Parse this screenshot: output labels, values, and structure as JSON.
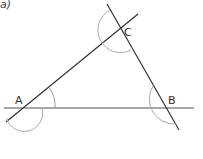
{
  "part_label": "a)",
  "vertices": {
    "A": {
      "label": "A"
    },
    "B": {
      "label": "B"
    },
    "C": {
      "label": "C"
    }
  },
  "colors": {
    "line": "#333333",
    "arc": "#aaaaaa",
    "text": "#333333"
  }
}
